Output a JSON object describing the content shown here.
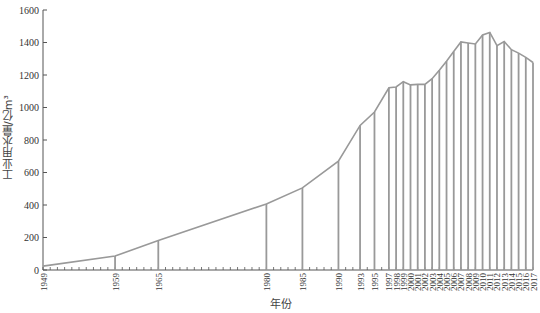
{
  "chart_data": {
    "type": "area",
    "title": "",
    "xlabel": "年份",
    "ylabel": "工业用水量/亿m³",
    "ylim": [
      0,
      1600
    ],
    "yticks": [
      0,
      200,
      400,
      600,
      800,
      1000,
      1200,
      1400,
      1600
    ],
    "grid": false,
    "legend": null,
    "x": [
      1949,
      1959,
      1965,
      1980,
      1985,
      1990,
      1993,
      1995,
      1997,
      1998,
      1999,
      2000,
      2001,
      2002,
      2003,
      2004,
      2005,
      2006,
      2007,
      2008,
      2009,
      2010,
      2011,
      2012,
      2013,
      2014,
      2015,
      2016,
      2017
    ],
    "series": [
      {
        "name": "工业用水量",
        "values": [
          24,
          86,
          181,
          407,
          505,
          670,
          890,
          972,
          1121,
          1126,
          1159,
          1139,
          1142,
          1142,
          1177,
          1229,
          1285,
          1344,
          1404,
          1397,
          1391,
          1447,
          1462,
          1381,
          1406,
          1356,
          1335,
          1308,
          1277
        ]
      }
    ],
    "x_tick_labels": [
      "1949",
      "1959",
      "1965",
      "1980",
      "1985",
      "1990",
      "1993",
      "1995",
      "1997",
      "1998",
      "1999",
      "2000",
      "2001",
      "2002",
      "2003",
      "2004",
      "2005",
      "2006",
      "2007",
      "2008",
      "2009",
      "2010",
      "2011",
      "2012",
      "2013",
      "2014",
      "2015",
      "2016",
      "2017"
    ],
    "colors": {
      "line": "#999999",
      "axis": "#555555",
      "text": "#333333"
    }
  }
}
